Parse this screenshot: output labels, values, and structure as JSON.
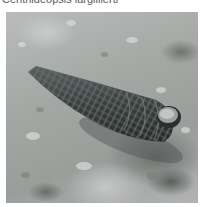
{
  "caption": {
    "text": "Cerithideopsis largillierti"
  },
  "photo": {
    "subject": "horn snail shell lying on wet mud",
    "colors": {
      "mud_light": "#c9ccca",
      "mud_mid": "#a4a8a5",
      "mud_dark": "#6d716e",
      "shell_dark": "#3a3f3e",
      "shell_ridge": "#5d6463",
      "aperture": "#9da1a0"
    }
  }
}
